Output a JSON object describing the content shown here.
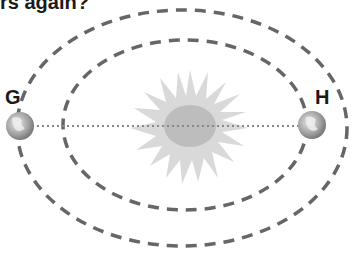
{
  "question": {
    "partial_text": "rs again?"
  },
  "diagram": {
    "type": "orbit",
    "labels": {
      "left_planet": "G",
      "right_planet": "H"
    },
    "elements": [
      "sun",
      "inner-orbit",
      "outer-orbit",
      "planet-G",
      "planet-H",
      "sun-line"
    ],
    "colors": {
      "orbit": "#666666",
      "sun_rays": "#d9d9d9",
      "sun_core": "#bdbdbd",
      "line": "#888888"
    }
  }
}
